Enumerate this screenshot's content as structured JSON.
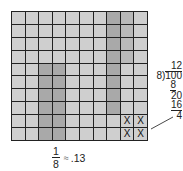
{
  "grid": {
    "rows": 10,
    "columns": 10,
    "colors": {
      "base": "#cfcfcf",
      "dark": "#a9a9a9",
      "medium": "#b9b9b9",
      "line": "#222222"
    },
    "shading": [
      [
        "base",
        "base",
        "base",
        "base",
        "base",
        "base",
        "base",
        "dark",
        "med",
        "base"
      ],
      [
        "base",
        "base",
        "base",
        "base",
        "base",
        "base",
        "base",
        "dark",
        "med",
        "base"
      ],
      [
        "base",
        "base",
        "base",
        "base",
        "base",
        "base",
        "base",
        "dark",
        "med",
        "base"
      ],
      [
        "base",
        "base",
        "base",
        "base",
        "base",
        "base",
        "base",
        "dark",
        "med",
        "base"
      ],
      [
        "base",
        "base",
        "dark",
        "dark",
        "base",
        "base",
        "base",
        "dark",
        "base",
        "base"
      ],
      [
        "base",
        "base",
        "dark",
        "dark",
        "base",
        "base",
        "base",
        "dark",
        "base",
        "base"
      ],
      [
        "base",
        "base",
        "dark",
        "dark",
        "base",
        "base",
        "base",
        "dark",
        "base",
        "base"
      ],
      [
        "base",
        "base",
        "dark",
        "dark",
        "base",
        "base",
        "base",
        "dark",
        "base",
        "base"
      ],
      [
        "base",
        "base",
        "dark",
        "dark",
        "base",
        "base",
        "base",
        "base",
        "base",
        "base"
      ],
      [
        "base",
        "base",
        "dark",
        "dark",
        "base",
        "base",
        "base",
        "base",
        "base",
        "base"
      ]
    ],
    "marks": [
      {
        "row": 8,
        "col": 8,
        "label": "X"
      },
      {
        "row": 8,
        "col": 9,
        "label": "X"
      },
      {
        "row": 9,
        "col": 8,
        "label": "X"
      },
      {
        "row": 9,
        "col": 9,
        "label": "X"
      }
    ]
  },
  "division": {
    "quotient": "12",
    "divisor": "8",
    "dividend": "100",
    "step1_subtract": "8",
    "step1_result": "20",
    "step2_subtract": "16",
    "remainder": "4"
  },
  "caption": {
    "numerator": "1",
    "denominator": "8",
    "approx_symbol": "≈",
    "value": ".13"
  }
}
